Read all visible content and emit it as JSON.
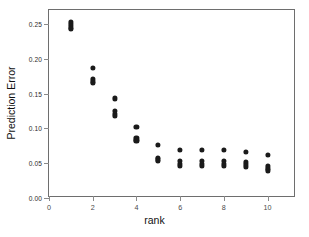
{
  "chart_data": {
    "type": "scatter",
    "title": "",
    "xlabel": "rank",
    "ylabel": "Prediction Error",
    "xlim": [
      0,
      11.3
    ],
    "ylim": [
      0.0,
      0.27
    ],
    "grid": false,
    "legend": null,
    "xticks": [
      0,
      2,
      4,
      6,
      8,
      10
    ],
    "xticklabels": [
      "0",
      "2",
      "4",
      "6",
      "8",
      "10"
    ],
    "yticks": [
      0.0,
      0.05,
      0.1,
      0.15,
      0.2,
      0.25
    ],
    "yticklabels": [
      "0.00",
      "0.05",
      "0.10",
      "0.15",
      "0.20",
      "0.25"
    ],
    "marker": "filled-circle",
    "marker_color": "#1a1a1a",
    "series": [
      {
        "name": "prediction error by rank",
        "points": [
          {
            "x": 1,
            "y": 0.253
          },
          {
            "x": 1,
            "y": 0.2495
          },
          {
            "x": 1,
            "y": 0.247
          },
          {
            "x": 1,
            "y": 0.2445
          },
          {
            "x": 1,
            "y": 0.2425
          },
          {
            "x": 2,
            "y": 0.187
          },
          {
            "x": 2,
            "y": 0.1705
          },
          {
            "x": 2,
            "y": 0.1675
          },
          {
            "x": 2,
            "y": 0.1655
          },
          {
            "x": 3,
            "y": 0.143
          },
          {
            "x": 3,
            "y": 0.1245
          },
          {
            "x": 3,
            "y": 0.1205
          },
          {
            "x": 3,
            "y": 0.1175
          },
          {
            "x": 4,
            "y": 0.102
          },
          {
            "x": 4,
            "y": 0.0865
          },
          {
            "x": 4,
            "y": 0.084
          },
          {
            "x": 4,
            "y": 0.0815
          },
          {
            "x": 5,
            "y": 0.0765
          },
          {
            "x": 5,
            "y": 0.058
          },
          {
            "x": 5,
            "y": 0.0555
          },
          {
            "x": 5,
            "y": 0.0535
          },
          {
            "x": 6,
            "y": 0.0685
          },
          {
            "x": 6,
            "y": 0.0535
          },
          {
            "x": 6,
            "y": 0.0495
          },
          {
            "x": 6,
            "y": 0.0465
          },
          {
            "x": 7,
            "y": 0.0685
          },
          {
            "x": 7,
            "y": 0.0535
          },
          {
            "x": 7,
            "y": 0.0495
          },
          {
            "x": 7,
            "y": 0.0465
          },
          {
            "x": 8,
            "y": 0.0685
          },
          {
            "x": 8,
            "y": 0.0535
          },
          {
            "x": 8,
            "y": 0.0495
          },
          {
            "x": 8,
            "y": 0.0465
          },
          {
            "x": 9,
            "y": 0.0665
          },
          {
            "x": 9,
            "y": 0.0515
          },
          {
            "x": 9,
            "y": 0.0485
          },
          {
            "x": 9,
            "y": 0.0455
          },
          {
            "x": 10,
            "y": 0.062
          },
          {
            "x": 10,
            "y": 0.046
          },
          {
            "x": 10,
            "y": 0.0425
          },
          {
            "x": 10,
            "y": 0.0395
          }
        ]
      }
    ]
  },
  "colors": {
    "marker": "#1a1a1a",
    "frame": "#6e6e6e",
    "tick_label": "#3a3a3a",
    "background": "#ffffff"
  }
}
